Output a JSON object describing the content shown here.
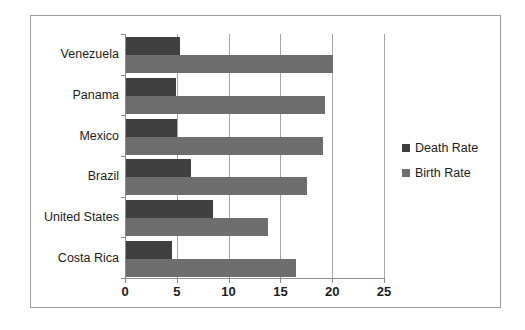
{
  "chart_data": {
    "type": "bar",
    "orientation": "horizontal",
    "title": "",
    "xlabel": "",
    "ylabel": "",
    "xlim": [
      0,
      25
    ],
    "xticks": [
      "0",
      "5",
      "10",
      "15",
      "20",
      "25"
    ],
    "grid": true,
    "legend_position": "right",
    "categories": [
      "Venezuela",
      "Panama",
      "Mexico",
      "Brazil",
      "United States",
      "Costa Rica"
    ],
    "series": [
      {
        "name": "Death Rate",
        "color": "#404040",
        "values": [
          5.2,
          4.8,
          4.9,
          6.3,
          8.4,
          4.4
        ]
      },
      {
        "name": "Birth Rate",
        "color": "#6e6e6e",
        "values": [
          20.0,
          19.2,
          19.0,
          17.5,
          13.7,
          16.4
        ]
      }
    ]
  },
  "legend": {
    "items": [
      {
        "label": "Death Rate",
        "color": "#404040"
      },
      {
        "label": "Birth Rate",
        "color": "#6e6e6e"
      }
    ]
  },
  "colors": {
    "death_rate": "#404040",
    "birth_rate": "#6e6e6e",
    "grid": "#a6a6a6",
    "axis": "#8c8c8c",
    "frame_border": "#9d9d9d",
    "text": "#1c1c1c",
    "background": "#ffffff"
  }
}
